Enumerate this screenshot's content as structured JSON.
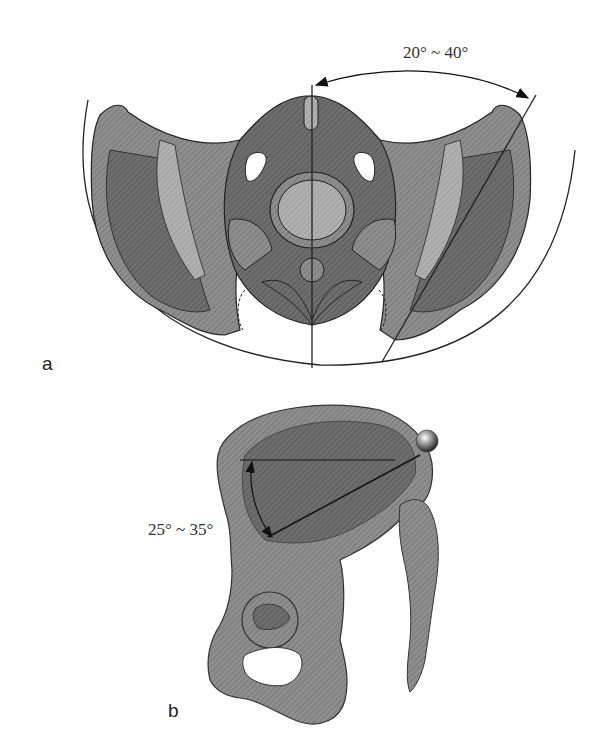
{
  "figure": {
    "panel_a": {
      "label": "a",
      "angle_annotation": "20° ~ 40°",
      "description": "Pelvis viewed from above, showing angle between midline and oblique line"
    },
    "panel_b": {
      "label": "b",
      "angle_annotation": "25° ~ 35°",
      "description": "Lateral view of hip bone with horizontal reference line and inclined line to sphere marker"
    },
    "colors": {
      "bone_fill": "#8a8a8a",
      "bone_dark": "#5e5e5e",
      "bone_light": "#b8b8b8",
      "outline": "#2a2a2a",
      "background": "#ffffff"
    }
  }
}
